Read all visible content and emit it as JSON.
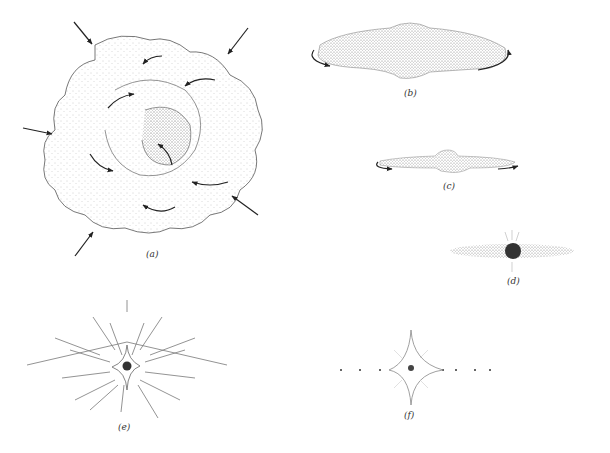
{
  "figure": {
    "panels": [
      {
        "id": "a",
        "label": "(a)",
        "description": "Contracting cloud with infalling arrows and internal turbulent eddies"
      },
      {
        "id": "b",
        "label": "(b)",
        "description": "Flattened rotating cloud with central bulge"
      },
      {
        "id": "c",
        "label": "(c)",
        "description": "Thinner rotating disk with central bulge"
      },
      {
        "id": "d",
        "label": "(d)",
        "description": "Protostar embedded in dusty disk"
      },
      {
        "id": "e",
        "label": "(e)",
        "description": "Star with radiating outflow lines"
      },
      {
        "id": "f",
        "label": "(f)",
        "description": "Star with planets in a line"
      }
    ],
    "colors": {
      "ink": "#222222",
      "stipple": "#9a9a9a",
      "star": "#333333"
    }
  }
}
